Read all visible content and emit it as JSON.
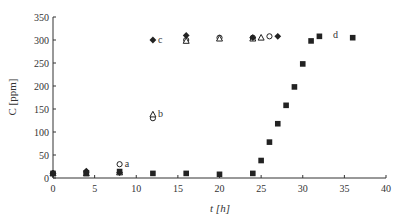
{
  "chart_data": {
    "type": "scatter",
    "title": "",
    "xlabel": "t [h]",
    "ylabel": "C [ppm]",
    "xlim": [
      0,
      40
    ],
    "ylim": [
      0,
      350
    ],
    "xticks": [
      0,
      5,
      10,
      15,
      20,
      25,
      30,
      35,
      40
    ],
    "yticks": [
      0,
      50,
      100,
      150,
      200,
      250,
      300,
      350
    ],
    "grid": false,
    "legend": "none (series identified by inline annotations a, b, c, d)",
    "series": [
      {
        "name": "a",
        "marker": "open-circle",
        "x": [
          0,
          4,
          8,
          12,
          16,
          20,
          24,
          26
        ],
        "y": [
          10,
          12,
          30,
          130,
          300,
          305,
          305,
          308
        ]
      },
      {
        "name": "b",
        "marker": "open-triangle",
        "x": [
          0,
          4,
          8,
          12,
          16,
          20,
          24,
          25
        ],
        "y": [
          10,
          10,
          12,
          138,
          298,
          303,
          303,
          305
        ]
      },
      {
        "name": "c",
        "marker": "filled-diamond",
        "x": [
          0,
          4,
          8,
          12,
          16,
          24,
          27
        ],
        "y": [
          10,
          15,
          12,
          300,
          310,
          305,
          308
        ]
      },
      {
        "name": "d",
        "marker": "filled-square",
        "x": [
          0,
          4,
          8,
          12,
          16,
          20,
          24,
          25,
          26,
          27,
          28,
          29,
          30,
          31,
          32,
          36
        ],
        "y": [
          10,
          10,
          14,
          10,
          10,
          8,
          10,
          38,
          78,
          118,
          158,
          198,
          248,
          298,
          308,
          305
        ]
      }
    ],
    "annotations": [
      {
        "text": "a",
        "x": 8.5,
        "y": 30
      },
      {
        "text": "b",
        "x": 12.5,
        "y": 140
      },
      {
        "text": "c",
        "x": 12.5,
        "y": 300
      },
      {
        "text": "d",
        "x": 33.5,
        "y": 310
      }
    ]
  }
}
